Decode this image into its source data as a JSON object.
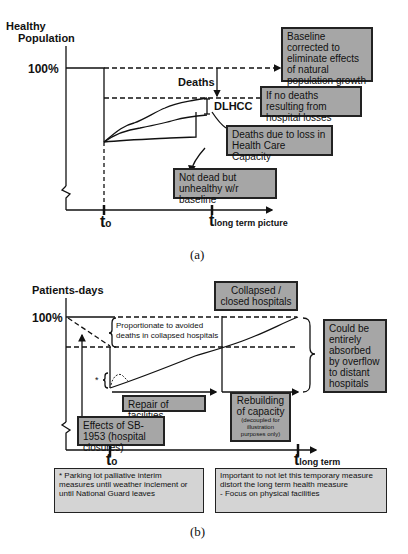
{
  "panel_a": {
    "y_axis_label_line1": "Healthy",
    "y_axis_label_line2": "Population",
    "y_tick_100": "100%",
    "deaths_label": "Deaths",
    "dlhcc_label": "DLHCC",
    "t0_label": "t",
    "t0_sub": "o",
    "t_long_label": "t",
    "t_long_sub": "long term picture",
    "box_baseline": "Baseline corrected to eliminate effects of natural population growth",
    "box_no_deaths": "If no deaths resulting from hospital losses",
    "box_deaths_loss": "Deaths due to loss in Health Care Capacity",
    "box_not_dead": "Not dead but unhealthy w/r baseline",
    "caption": "(a)"
  },
  "panel_b": {
    "y_axis_label": "Patients-days",
    "y_tick_100": "100%",
    "box_collapsed": "Collapsed / closed hospitals",
    "proportionate_label_line1": "Proportionate to avoided",
    "proportionate_label_line2": "deaths in collapsed hospitals",
    "asterisk": "*",
    "box_absorbed": "Could be entirely absorbed by overflow to distant hospitals",
    "box_repair": "Repair of facilities",
    "box_rebuilding_title": "Rebuilding of capacity",
    "box_rebuilding_note": "(decoupled for illustration purposes only)",
    "box_sb1953": "Effects of SB-1953 (hospital closures)",
    "t0_label": "t",
    "t0_sub": "o",
    "t_long_label": "t",
    "t_long_sub": "long term",
    "box_parking": "* Parking lot palliative interim measures until weather inclement or until National Guard leaves",
    "box_important_line1": "Important to not let this temporary measure distort the long term health measure",
    "box_important_line2": "- Focus on physical facilities",
    "caption": "(b)"
  },
  "colors": {
    "box_fill": "#a6a6a6",
    "box_fill_light": "#d4d4d4",
    "line": "#111111"
  }
}
